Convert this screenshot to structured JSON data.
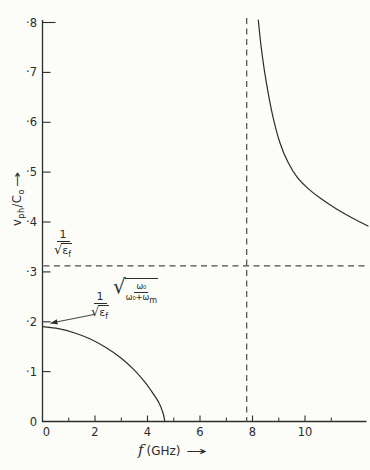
{
  "figure": {
    "background": "#fcfcf9",
    "ink": "#2c2c2c",
    "dash_color": "#4a4a4a"
  },
  "chart_data": {
    "type": "line",
    "title": "",
    "xlabel": {
      "f": "f",
      "unit": "(GHz)",
      "arrow": "→"
    },
    "ylabel": {
      "v": "v",
      "v_sub": "ph",
      "c": "/C",
      "c_sub": "o",
      "arrow": "→"
    },
    "x_range": [
      0,
      12.4
    ],
    "y_range": [
      0,
      0.8
    ],
    "grid": false,
    "x_major_ticks": [
      {
        "f": 0,
        "label": "0"
      },
      {
        "f": 2,
        "label": "2"
      },
      {
        "f": 4,
        "label": "4"
      },
      {
        "f": 6,
        "label": "6"
      },
      {
        "f": 8,
        "label": "8"
      },
      {
        "f": 10,
        "label": "10"
      }
    ],
    "x_minor_ticks": [
      1,
      3,
      5,
      7,
      9,
      11
    ],
    "y_ticks": [
      {
        "v": 0.8,
        "label": "·8"
      },
      {
        "v": 0.7,
        "label": "·7"
      },
      {
        "v": 0.6,
        "label": "·6"
      },
      {
        "v": 0.5,
        "label": "·5"
      },
      {
        "v": 0.4,
        "label": "·4"
      },
      {
        "v": 0.3,
        "label": "·3"
      },
      {
        "v": 0.2,
        "label": "·2"
      },
      {
        "v": 0.1,
        "label": "·1"
      },
      {
        "v": 0.0,
        "label": "0"
      }
    ],
    "hline": {
      "v": 0.312,
      "style": "dashed",
      "meaning": "1/sqrt(eps_f) asymptote"
    },
    "vline": {
      "f": 7.78,
      "style": "dashed",
      "meaning": "resonance frequency"
    },
    "series": [
      {
        "name": "lower-branch",
        "points": [
          [
            0,
            0.19
          ],
          [
            0.6,
            0.186
          ],
          [
            1.2,
            0.178
          ],
          [
            1.8,
            0.166
          ],
          [
            2.4,
            0.149
          ],
          [
            3.0,
            0.127
          ],
          [
            3.5,
            0.103
          ],
          [
            3.9,
            0.079
          ],
          [
            4.2,
            0.057
          ],
          [
            4.45,
            0.036
          ],
          [
            4.6,
            0.015
          ],
          [
            4.66,
            0
          ]
        ]
      },
      {
        "name": "upper-branch",
        "points": [
          [
            8.22,
            0.805
          ],
          [
            8.32,
            0.755
          ],
          [
            8.45,
            0.705
          ],
          [
            8.62,
            0.652
          ],
          [
            8.82,
            0.602
          ],
          [
            9.05,
            0.558
          ],
          [
            9.35,
            0.52
          ],
          [
            9.7,
            0.49
          ],
          [
            10.1,
            0.468
          ],
          [
            10.6,
            0.447
          ],
          [
            11.2,
            0.426
          ],
          [
            11.8,
            0.408
          ],
          [
            12.4,
            0.392
          ]
        ]
      }
    ],
    "annotations": {
      "hline_formula": {
        "num": "1",
        "sqrt": "√",
        "eps": "ε",
        "eps_sub": "f"
      },
      "start_formula": {
        "num": "1",
        "sqrt": "√",
        "eps": "ε",
        "eps_sub": "f",
        "rad_sqrt": "√",
        "rad_num": "ω₀",
        "rad_den": "ω₀+ω",
        "rad_den_sub": "m"
      },
      "leader": {
        "from": {
          "f": 2.0,
          "v": 0.215
        },
        "to": {
          "f": 0.3,
          "v": 0.197
        }
      }
    }
  }
}
